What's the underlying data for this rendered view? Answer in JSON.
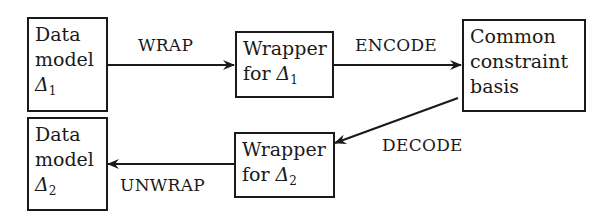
{
  "diagram": {
    "nodes": {
      "data_model_1": {
        "lines": [
          "Data",
          "model"
        ],
        "symbol": "Δ",
        "subscript": "1"
      },
      "wrapper_1": {
        "lines": [
          "Wrapper"
        ],
        "prefix": "for ",
        "symbol": "Δ",
        "subscript": "1"
      },
      "common_basis": {
        "lines": [
          "Common",
          "constraint",
          "basis"
        ]
      },
      "wrapper_2": {
        "lines": [
          "Wrapper"
        ],
        "prefix": "for ",
        "symbol": "Δ",
        "subscript": "2"
      },
      "data_model_2": {
        "lines": [
          "Data",
          "model"
        ],
        "symbol": "Δ",
        "subscript": "2"
      }
    },
    "edges": {
      "wrap": "WRAP",
      "encode": "ENCODE",
      "decode": "DECODE",
      "unwrap": "UNWRAP"
    },
    "colors": {
      "stroke": "#1a1a1a",
      "background": "#ffffff"
    }
  }
}
